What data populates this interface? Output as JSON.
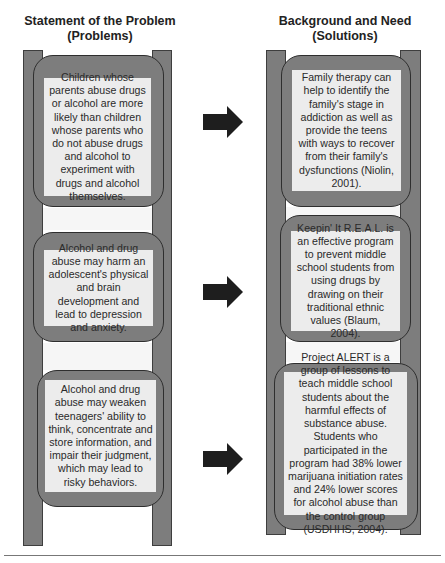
{
  "columns": {
    "left": {
      "title_line1": "Statement of the Problem",
      "title_line2": "(Problems)",
      "items": [
        {
          "text": "Children whose parents abuse drugs or alcohol are more likely than children whose parents who do not abuse drugs and alcohol to experiment with drugs and alcohol themselves."
        },
        {
          "text": "Alcohol and drug abuse may harm an adolescent's physical and brain development and lead to depression and anxiety."
        },
        {
          "text": "Alcohol and drug abuse may weaken teenagers' ability to think, concentrate and store information, and impair their judgment, which may lead to risky behaviors."
        }
      ]
    },
    "right": {
      "title_line1": "Background and Need",
      "title_line2": "(Solutions)",
      "items": [
        {
          "text": "Family therapy can help to identify the family's stage in addiction as well as provide the teens with ways to recover from their family's dysfunctions (Niolin, 2001)."
        },
        {
          "text": "Keepin' It R.E.A.L. is an effective program to prevent middle school students from using drugs by drawing on their traditional ethnic values (Blaum, 2004)."
        },
        {
          "text": "Project ALERT is a group of lessons to teach middle school students about the harmful effects of substance abuse. Students who participated in the program had 38% lower marijuana initiation rates and 24% lower scores for alcohol abuse than the control group (USDHHS, 2004)."
        }
      ]
    }
  },
  "connectors": [
    {
      "from": "problem-1",
      "to": "solution-1",
      "icon": "right-arrow-icon"
    },
    {
      "from": "problem-2",
      "to": "solution-2",
      "icon": "right-arrow-icon"
    },
    {
      "from": "problem-3",
      "to": "solution-3",
      "icon": "right-arrow-icon"
    }
  ],
  "colors": {
    "rail": "#7d7d7d",
    "panel": "#ececec",
    "arrow": "#1e1e1e"
  }
}
